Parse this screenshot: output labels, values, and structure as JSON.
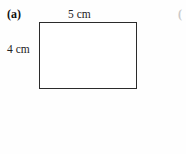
{
  "figure": {
    "part_label": "(a)",
    "next_part_label_partial": "(",
    "shape": {
      "name": "rectangle",
      "width_label": "5 cm",
      "height_label": "4 cm",
      "width_value": 5,
      "height_value": 4,
      "unit": "cm",
      "fill_color": "#ffffff",
      "stroke_color": "#2b2b2b"
    }
  },
  "page": {
    "background_color": "#fefefe",
    "text_color": "#1a1a1a"
  }
}
